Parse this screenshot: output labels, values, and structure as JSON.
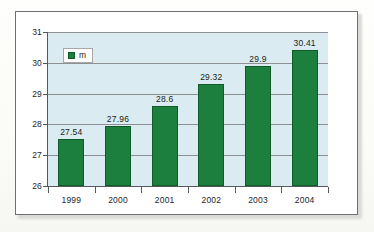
{
  "chart_data": {
    "type": "bar",
    "title": "",
    "xlabel": "",
    "ylabel": "",
    "categories": [
      "1999",
      "2000",
      "2001",
      "2002",
      "2003",
      "2004"
    ],
    "values": [
      27.54,
      27.96,
      28.6,
      29.32,
      29.9,
      30.41
    ],
    "value_labels": [
      "27.54",
      "27.96",
      "28.6",
      "29.32",
      "29.9",
      "30.41"
    ],
    "series": [
      {
        "name": "m",
        "color": "#1d7f3e",
        "values": [
          27.54,
          27.96,
          28.6,
          29.32,
          29.9,
          30.41
        ]
      }
    ],
    "ylim": [
      26,
      31
    ],
    "yticks": [
      26,
      27,
      28,
      29,
      30,
      31
    ],
    "ytick_labels": [
      "26",
      "27",
      "28",
      "29",
      "30",
      "31"
    ],
    "grid": true,
    "legend": {
      "position": "top-left",
      "entries": [
        {
          "label": "m",
          "color": "#1d7f3e"
        }
      ]
    },
    "plot_background": "#daecf1",
    "gridline_color": "#8d8f92",
    "axis_color": "#56585b",
    "frame_color": "#6f6f71"
  }
}
